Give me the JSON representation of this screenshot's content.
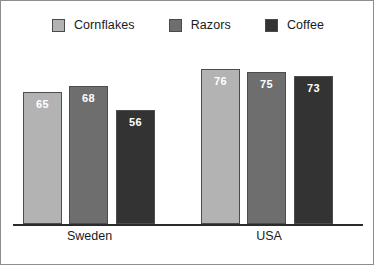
{
  "chart_data": {
    "type": "bar",
    "title": "",
    "subtitle": "",
    "xlabel": "",
    "ylabel": "",
    "categories": [
      "Sweden",
      "USA"
    ],
    "series": [
      {
        "name": "Cornflakes",
        "values": [
          65,
          76
        ],
        "color": "#b3b3b3"
      },
      {
        "name": "Razors",
        "values": [
          68,
          75
        ],
        "color": "#6e6e6e"
      },
      {
        "name": "Coffee",
        "values": [
          56,
          73
        ],
        "color": "#333333"
      }
    ],
    "ylim": [
      0,
      90
    ],
    "grid": false,
    "legend_position": "top",
    "value_labels": true,
    "axis_line_color": "#2b2b2b",
    "value_label_color": "#ffffff",
    "background_color": "#ffffff",
    "border_color": "#8d8d8d"
  }
}
